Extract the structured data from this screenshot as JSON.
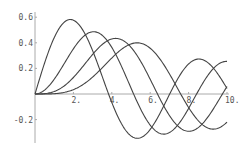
{
  "chart_data": {
    "type": "line",
    "title": "",
    "xlabel": "",
    "ylabel": "",
    "xlim": [
      0,
      10
    ],
    "ylim": [
      -0.35,
      0.62
    ],
    "grid": false,
    "legend": null,
    "x_ticks": [
      {
        "value": 2,
        "label": "2."
      },
      {
        "value": 4,
        "label": "4."
      },
      {
        "value": 6,
        "label": "6."
      },
      {
        "value": 8,
        "label": "8."
      },
      {
        "value": 10,
        "label": "10."
      }
    ],
    "y_ticks": [
      {
        "value": 0.6,
        "label": "0.6"
      },
      {
        "value": 0.4,
        "label": "0.4"
      },
      {
        "value": 0.2,
        "label": "0.2"
      },
      {
        "value": -0.2,
        "label": "-0.2"
      }
    ],
    "series": [
      {
        "name": "BesselJ[1,x]",
        "order": 1,
        "color": "#444444",
        "x": [
          0,
          1,
          2,
          3,
          4,
          5,
          6,
          7,
          8,
          9,
          10
        ],
        "values": [
          0,
          0.44,
          0.577,
          0.339,
          -0.066,
          -0.328,
          -0.277,
          -0.005,
          0.235,
          0.245,
          0.043
        ]
      },
      {
        "name": "BesselJ[2,x]",
        "order": 2,
        "color": "#444444",
        "x": [
          0,
          1,
          2,
          3,
          4,
          5,
          6,
          7,
          8,
          9,
          10
        ],
        "values": [
          0,
          0.115,
          0.353,
          0.486,
          0.364,
          0.047,
          -0.243,
          -0.301,
          -0.113,
          0.145,
          0.255
        ]
      },
      {
        "name": "BesselJ[3,x]",
        "order": 3,
        "color": "#444444",
        "x": [
          0,
          1,
          2,
          3,
          4,
          5,
          6,
          7,
          8,
          9,
          10
        ],
        "values": [
          0,
          0.02,
          0.129,
          0.309,
          0.43,
          0.365,
          0.115,
          -0.168,
          -0.291,
          -0.181,
          0.058
        ]
      },
      {
        "name": "BesselJ[4,x]",
        "order": 4,
        "color": "#444444",
        "x": [
          0,
          1,
          2,
          3,
          4,
          5,
          6,
          7,
          8,
          9,
          10
        ],
        "values": [
          0,
          0.002,
          0.034,
          0.132,
          0.281,
          0.391,
          0.358,
          0.158,
          -0.105,
          -0.265,
          -0.22
        ]
      }
    ]
  },
  "layout": {
    "origin_px": [
      35,
      94
    ],
    "x_px_per_unit": 19.2,
    "y_px_per_unit": 128,
    "y_axis_top_px": 12,
    "y_axis_bottom_px": 143,
    "x_axis_right_px": 229
  }
}
